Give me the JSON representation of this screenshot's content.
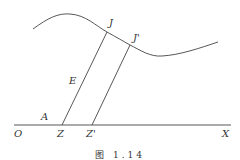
{
  "figure": {
    "caption": "图 1.14",
    "colors": {
      "stroke": "#444444",
      "text": "#333333",
      "background": "#ffffff"
    },
    "labels": {
      "O": "O",
      "A": "A",
      "Z": "Z",
      "Z_prime": "Z'",
      "X": "X",
      "E": "E",
      "J": "J",
      "J_prime": "J'"
    },
    "geometry": {
      "axis": {
        "x1": 14,
        "y1": 125,
        "x2": 231,
        "y2": 125
      },
      "curve_path": "M33,29 C48,18 58,13 70,14 C86,15 96,26 107,32 C116,37 123,41 130,45 C140,50 150,57 162,56 C180,55 200,48 218,42",
      "segment_ZJ": {
        "x1": 62,
        "y1": 125,
        "x2": 107,
        "y2": 32
      },
      "segment_Z_prime_J_prime": {
        "x1": 92,
        "y1": 125,
        "x2": 130,
        "y2": 45
      }
    }
  }
}
